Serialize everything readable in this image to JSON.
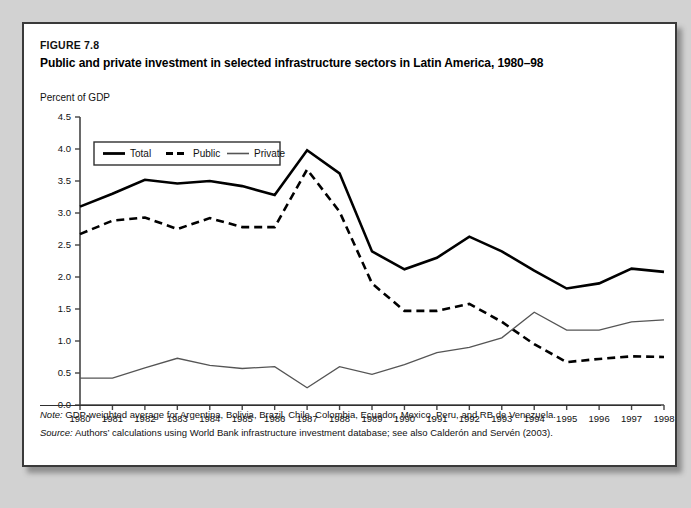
{
  "figure": {
    "number": "FIGURE 7.8",
    "title": "Public and private investment in selected infrastructure sectors in Latin America, 1980–98",
    "note_label": "Note:",
    "note_text": "GDP-weighted average for Argentina, Bolivia, Brazil, Chile, Colombia, Ecuador, Mexico, Peru, and RB de Venezuela.",
    "source_label": "Source:",
    "source_text": "Authors’ calculations using World Bank infrastructure investment database; see also Calderón and Servén (2003)."
  },
  "colors": {
    "total": "#000000",
    "public": "#000000",
    "private": "#555555",
    "axis": "#444444",
    "frame": "#3a3a3a",
    "page_background": "#d2d2d2",
    "panel_background": "#ffffff"
  },
  "chart_data": {
    "type": "line",
    "title": "Public and private investment in selected infrastructure sectors in Latin America, 1980–98",
    "xlabel": "",
    "ylabel": "Percent of GDP",
    "ylabel_position": "above-axis",
    "grid": false,
    "legend_position": "top-left-inside",
    "xlim": [
      1980,
      1998
    ],
    "ylim": [
      0.0,
      4.5
    ],
    "yticks": [
      "0.0",
      "0.5",
      "1.0",
      "1.5",
      "2.0",
      "2.5",
      "3.0",
      "3.5",
      "4.0",
      "4.5"
    ],
    "ytick_values": [
      0.0,
      0.5,
      1.0,
      1.5,
      2.0,
      2.5,
      3.0,
      3.5,
      4.0,
      4.5
    ],
    "categories": [
      1980,
      1981,
      1982,
      1983,
      1984,
      1985,
      1986,
      1987,
      1988,
      1989,
      1990,
      1991,
      1992,
      1993,
      1994,
      1995,
      1996,
      1997,
      1998
    ],
    "xtick_labels": [
      "1980",
      "1981",
      "1982",
      "1983",
      "1984",
      "1985",
      "1986",
      "1987",
      "1988",
      "1989",
      "1990",
      "1991",
      "1992",
      "1993",
      "1994",
      "1995",
      "1996",
      "1997",
      "1998"
    ],
    "series": [
      {
        "name": "Total",
        "style": "solid",
        "width": "thick",
        "color": "#000000",
        "values": [
          3.1,
          3.3,
          3.52,
          3.46,
          3.5,
          3.42,
          3.28,
          3.98,
          3.62,
          2.4,
          2.12,
          2.3,
          2.63,
          2.4,
          2.1,
          1.82,
          1.9,
          2.13,
          2.08
        ]
      },
      {
        "name": "Public",
        "style": "dashed",
        "width": "thick",
        "color": "#000000",
        "values": [
          2.67,
          2.88,
          2.93,
          2.75,
          2.92,
          2.78,
          2.78,
          3.68,
          3.02,
          1.9,
          1.47,
          1.47,
          1.58,
          1.3,
          0.95,
          0.67,
          0.72,
          0.76,
          0.75
        ]
      },
      {
        "name": "Private",
        "style": "solid",
        "width": "thin",
        "color": "#555555",
        "values": [
          0.42,
          0.42,
          0.58,
          0.73,
          0.62,
          0.57,
          0.6,
          0.27,
          0.6,
          0.48,
          0.63,
          0.82,
          0.9,
          1.05,
          1.45,
          1.17,
          1.17,
          1.3,
          1.33
        ]
      }
    ]
  }
}
